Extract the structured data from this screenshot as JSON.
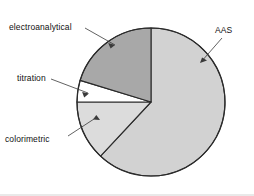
{
  "chart_data": {
    "type": "pie",
    "title": "",
    "subtitle": "",
    "xlabel": "",
    "ylabel": "",
    "legend_position": "none",
    "grid": false,
    "labels_placement": "callout-leader-lines",
    "start_angle_deg": 0,
    "direction": "clockwise",
    "center": {
      "x": 151,
      "y": 102
    },
    "radius": 74,
    "categories": [
      "AAS",
      "colorimetric",
      "titration",
      "electroanalytical"
    ],
    "values": [
      62,
      13,
      5,
      20
    ],
    "units": "percent",
    "slices": [
      {
        "label": "AAS",
        "value": 62,
        "start_angle_deg": 0,
        "end_angle_deg": 223,
        "color": "#d2d2d2",
        "edge_color": "#2b2b2b"
      },
      {
        "label": "colorimetric",
        "value": 13,
        "start_angle_deg": 223,
        "end_angle_deg": 270,
        "color": "#dcdcdc",
        "edge_color": "#2b2b2b"
      },
      {
        "label": "titration",
        "value": 5,
        "start_angle_deg": 270,
        "end_angle_deg": 287,
        "color": "#ffffff",
        "edge_color": "#2b2b2b"
      },
      {
        "label": "electroanalytical",
        "value": 20,
        "start_angle_deg": 287,
        "end_angle_deg": 360,
        "color": "#a8a8a8",
        "edge_color": "#2b2b2b"
      }
    ]
  },
  "labels": {
    "electroanalytical": "electroanalytical",
    "titration": "titration",
    "colorimetric": "colorimetric",
    "aas": "AAS"
  },
  "colors": {
    "background": "#ffffff",
    "outline": "#2b2b2b",
    "leader_line": "#3a3a3a",
    "text": "#111111",
    "aas_slice": "#d2d2d2",
    "colorimetric_slice": "#dcdcdc",
    "titration_slice": "#ffffff",
    "electroanalytical_slice": "#a8a8a8"
  }
}
